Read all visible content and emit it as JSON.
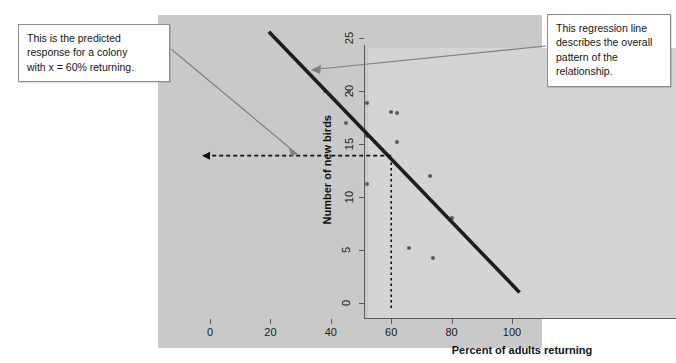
{
  "figure": {
    "panel_bg": "#c9c9c9",
    "plot_bg": "#d4d4d4",
    "axis_color": "#5a5a5a",
    "point_color": "#555a63",
    "regression_color": "#1d1d1d",
    "dashed_color": "#111111",
    "leader_color": "#7c7f88"
  },
  "annotations": {
    "predicted": {
      "text": "This is the predicted response for a colony with x = 60% returning.",
      "line1": "This is the predicted",
      "line2": "response for a colony",
      "line3": "with x = 60% returning."
    },
    "regression": {
      "text": "This regression line describes the overall pattern of the relationship.",
      "line1": "This regression line",
      "line2": "describes the overall",
      "line3": "pattern of the",
      "line4": "relationship."
    }
  },
  "chart_data": {
    "type": "scatter",
    "title": "",
    "xlabel": "Percent of adults returning",
    "ylabel": "Number of new birds",
    "xlim": [
      0,
      102
    ],
    "ylim": [
      0,
      27
    ],
    "xticks": [
      0,
      20,
      40,
      60,
      80,
      100
    ],
    "yticks": [
      0,
      5,
      10,
      15,
      20,
      25
    ],
    "xtick_labels": [
      "0",
      "20",
      "40",
      "60",
      "80",
      "100"
    ],
    "ytick_labels": [
      "0",
      "5",
      "10",
      "15",
      "20",
      "25"
    ],
    "grid": false,
    "legend": "none",
    "points": [
      {
        "x": 38,
        "y": 20.0
      },
      {
        "x": 46,
        "y": 20.0
      },
      {
        "x": 52,
        "y": 18.9
      },
      {
        "x": 60,
        "y": 18.0
      },
      {
        "x": 62,
        "y": 17.9
      },
      {
        "x": 45,
        "y": 17.0
      },
      {
        "x": 52,
        "y": 15.8
      },
      {
        "x": 62,
        "y": 15.2
      },
      {
        "x": 73,
        "y": 12.0
      },
      {
        "x": 52,
        "y": 11.2
      },
      {
        "x": 80,
        "y": 8.0
      },
      {
        "x": 66,
        "y": 5.2
      },
      {
        "x": 74,
        "y": 4.2
      },
      {
        "x": 20,
        "y": 25.5
      }
    ],
    "regression_line": {
      "label": "regression line",
      "x_start": 19.5,
      "y_start": 25.6,
      "x_end": 102.5,
      "y_end": 1.0
    },
    "prediction_marker": {
      "x": 60,
      "y": 13.9,
      "vertical_guide": {
        "x": 60,
        "from_y": 0,
        "to_y": 13.9
      },
      "horizontal_guide": {
        "y": 13.9,
        "from_x": 0,
        "to_x": 60
      },
      "note": "predicted response at x = 60"
    }
  }
}
